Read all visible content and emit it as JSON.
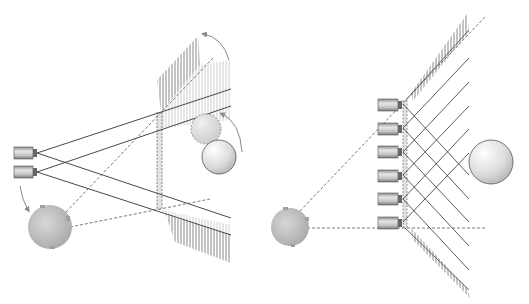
{
  "diagram": {
    "type": "camera-field-of-view-illustration",
    "panels": [
      {
        "id": "left",
        "description": "Two cameras with diverging view rays onto a rotating slatted reflector; light source below, sphere objects being rotated",
        "cameras": [
          {
            "x": 14,
            "y": 147
          },
          {
            "x": 14,
            "y": 166
          }
        ],
        "light_source": {
          "cx": 50,
          "cy": 227,
          "r": 22
        },
        "objects": [
          {
            "type": "sphere-ghost",
            "cx": 206,
            "cy": 129,
            "r": 15
          },
          {
            "type": "sphere",
            "cx": 219,
            "cy": 157,
            "r": 17
          }
        ]
      },
      {
        "id": "right",
        "description": "Six stacked cameras along a V-shaped slatted reflector with criss-crossing view rays; light source to the left, sphere target on the right",
        "cameras": [
          {
            "x": 378,
            "y": 99
          },
          {
            "x": 378,
            "y": 123
          },
          {
            "x": 378,
            "y": 146
          },
          {
            "x": 378,
            "y": 170
          },
          {
            "x": 378,
            "y": 193
          },
          {
            "x": 378,
            "y": 217
          }
        ],
        "light_source": {
          "cx": 290,
          "cy": 227,
          "r": 19
        },
        "objects": [
          {
            "type": "sphere",
            "cx": 491,
            "cy": 162,
            "r": 22
          }
        ]
      }
    ],
    "colors": {
      "line": "#333333",
      "dashed": "#555555",
      "hatch": "#888888",
      "camera_body": "#b8b8b8",
      "sphere_light": "#f2f2f2",
      "sphere_dark": "#bdbdbd",
      "arrow": "#8a8a8a"
    }
  }
}
